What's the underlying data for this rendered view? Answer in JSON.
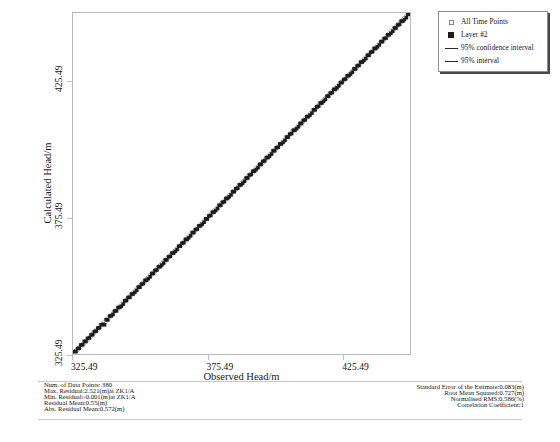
{
  "chart_data": {
    "type": "scatter",
    "title": "",
    "xlabel": "Observed Head/m",
    "ylabel": "Calculated Head/m",
    "xlim": [
      325.49,
      450.49
    ],
    "ylim": [
      325.49,
      450.49
    ],
    "xticks": [
      "325.49",
      "375.49",
      "425.49"
    ],
    "yticks": [
      "325.49",
      "375.49",
      "425.49"
    ],
    "xtick_values": [
      325.49,
      375.49,
      425.49
    ],
    "ytick_values": [
      325.49,
      375.49,
      425.49
    ],
    "grid": false,
    "legend_position": "top-right",
    "n_points": 380,
    "series": [
      {
        "name": "Layer #2",
        "marker": "filled-square",
        "color": "#1c1c1c",
        "description": "380 observed-vs-calculated head points lying essentially on the 1:1 line",
        "x": [
          326.1,
          326.6,
          327.2,
          327.8,
          328.4,
          329.1,
          329.7,
          330.3,
          330.9,
          331.6,
          332.2,
          332.8,
          333.4,
          334.1,
          334.7,
          335.3,
          335.9,
          336.6,
          337.2,
          337.8,
          338.4,
          339.1,
          339.7,
          340.3,
          340.9,
          341.6,
          342.2,
          342.8,
          343.4,
          344.1,
          344.7,
          345.3,
          345.9,
          346.6,
          347.2,
          347.8,
          348.4,
          349.1,
          349.7,
          350.3,
          350.9,
          351.6,
          352.2,
          352.8,
          353.4,
          354.1,
          354.7,
          355.3,
          355.9,
          356.6,
          357.2,
          357.8,
          358.4,
          359.1,
          359.7,
          360.3,
          360.9,
          361.6,
          362.2,
          362.8,
          363.4,
          364.1,
          364.7,
          365.3,
          365.9,
          366.6,
          367.2,
          367.8,
          368.4,
          369.1,
          369.7,
          370.3,
          370.9,
          371.6,
          372.2,
          372.8,
          373.4,
          374.1,
          374.7,
          375.3,
          375.9,
          376.6,
          377.2,
          377.8,
          378.4,
          379.1,
          379.7,
          380.3,
          380.9,
          381.6,
          382.2,
          382.8,
          383.4,
          384.1,
          384.7,
          385.3,
          385.9,
          386.6,
          387.2,
          387.8,
          388.4,
          389.1,
          389.7,
          390.3,
          390.9,
          391.6,
          392.2,
          392.8,
          393.4,
          394.1,
          394.7,
          395.3,
          395.9,
          396.6,
          397.2,
          397.8,
          398.4,
          399.1,
          399.7,
          400.3,
          400.9,
          401.6,
          402.2,
          402.8,
          403.4,
          404.1,
          404.7,
          405.3,
          405.9,
          406.6,
          407.2,
          407.8,
          408.4,
          409.1,
          409.7,
          410.3,
          410.9,
          411.6,
          412.2,
          412.8,
          413.4,
          414.1,
          414.7,
          415.3,
          415.9,
          416.6,
          417.2,
          417.8,
          418.4,
          419.1,
          419.7,
          420.3,
          420.9,
          421.6,
          422.2,
          422.8,
          423.4,
          424.1,
          424.7,
          425.3,
          425.9,
          426.6,
          427.2,
          427.8,
          428.4,
          429.1,
          429.7,
          430.3,
          430.9,
          431.6,
          432.2,
          432.8,
          433.4,
          434.1,
          434.7,
          435.3,
          435.9,
          436.6,
          437.2,
          437.8,
          438.4,
          439.1,
          439.7,
          440.3,
          440.9,
          441.6,
          442.2,
          442.8,
          443.4,
          444.1,
          444.7,
          445.3,
          445.9,
          446.6,
          447.2,
          447.8,
          448.4,
          449.1,
          449.7,
          450.2
        ],
        "y": [
          326.4,
          326.4,
          327.5,
          327.6,
          328.8,
          328.9,
          330.1,
          330.1,
          331.2,
          331.4,
          332.5,
          332.6,
          333.7,
          333.9,
          335.0,
          335.1,
          336.2,
          336.4,
          336.2,
          338.1,
          338.0,
          339.4,
          339.5,
          340.0,
          341.2,
          341.3,
          342.5,
          342.6,
          343.0,
          343.8,
          345.0,
          345.1,
          346.2,
          346.3,
          347.5,
          347.5,
          348.1,
          348.8,
          350.0,
          350.0,
          351.1,
          351.3,
          352.5,
          352.5,
          353.1,
          353.8,
          355.0,
          355.0,
          356.1,
          356.3,
          357.5,
          357.5,
          358.1,
          358.8,
          360.0,
          360.0,
          361.1,
          361.3,
          362.5,
          362.5,
          363.1,
          363.8,
          365.0,
          365.0,
          366.1,
          366.3,
          367.5,
          367.5,
          368.1,
          368.8,
          370.0,
          370.0,
          371.1,
          371.3,
          372.5,
          372.5,
          373.1,
          373.8,
          375.0,
          375.0,
          376.1,
          376.3,
          377.5,
          377.5,
          378.1,
          378.8,
          380.0,
          380.0,
          381.1,
          381.3,
          382.5,
          382.5,
          383.1,
          383.8,
          385.0,
          385.0,
          386.1,
          386.3,
          387.5,
          387.5,
          388.1,
          388.8,
          390.0,
          390.0,
          391.1,
          391.3,
          392.5,
          392.5,
          393.1,
          393.8,
          395.0,
          395.0,
          396.1,
          396.3,
          397.5,
          397.5,
          398.1,
          398.8,
          400.0,
          400.0,
          401.1,
          401.3,
          402.5,
          402.5,
          403.1,
          403.8,
          405.0,
          405.0,
          406.1,
          406.3,
          407.5,
          407.5,
          408.1,
          408.8,
          410.0,
          410.0,
          411.1,
          411.3,
          412.5,
          412.5,
          413.1,
          413.8,
          415.0,
          415.0,
          416.1,
          416.3,
          417.5,
          417.5,
          418.1,
          418.8,
          420.0,
          420.0,
          421.1,
          421.3,
          422.5,
          422.5,
          423.1,
          423.8,
          425.0,
          425.0,
          426.1,
          426.3,
          427.5,
          427.5,
          428.1,
          428.8,
          430.0,
          430.0,
          431.1,
          431.3,
          432.5,
          432.5,
          433.1,
          433.8,
          435.0,
          435.0,
          436.1,
          436.3,
          437.5,
          437.5,
          438.1,
          438.8,
          440.0,
          440.0,
          441.1,
          441.3,
          442.5,
          442.5,
          443.1,
          443.8,
          445.0,
          445.0,
          446.1,
          446.3,
          447.5,
          447.5,
          448.1,
          448.8,
          450.0,
          450.1
        ]
      }
    ],
    "reference_line": {
      "name": "1:1 line",
      "from": [
        325.49,
        325.49
      ],
      "to": [
        450.49,
        450.49
      ]
    }
  },
  "legend": {
    "items": [
      {
        "label": "All Time Points",
        "swatch": "open-square"
      },
      {
        "label": "Layer #2",
        "swatch": "filled-square"
      },
      {
        "label": "95% confidence interval",
        "swatch": "line"
      },
      {
        "label": "95% interval",
        "swatch": "line"
      }
    ]
  },
  "stats_left": [
    "Num. of Data Points: 380",
    "Max. Residual:2.521(m)at ZK1/A",
    "Min. Residual:-0.001(m)at ZK1/A",
    "Residual Mean:0.55(m)",
    "Abs. Residual Mean:0.572(m)"
  ],
  "stats_right": [
    "Standard Error of the Estimate:0.083(m)",
    "Root Mean Squared:0.727(m)",
    "Normalised RMS:0.586(%)",
    "Correlation Coefficient:1"
  ]
}
